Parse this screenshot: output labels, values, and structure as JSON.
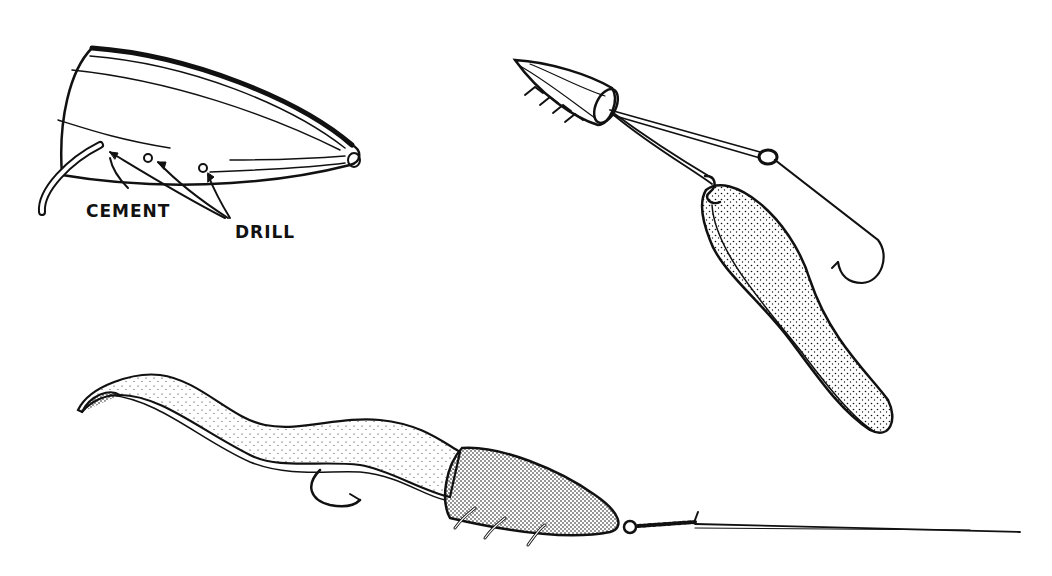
{
  "figure": {
    "labels": {
      "cement": "CEMENT",
      "drill": "DRILL"
    },
    "panels": [
      {
        "name": "lure-head-drilled",
        "caption": ""
      },
      {
        "name": "rigged-head-with-spoon-and-hook",
        "caption": ""
      },
      {
        "name": "worm-lure-on-line",
        "caption": ""
      }
    ]
  },
  "colors": {
    "ink": "#111111",
    "paper": "#ffffff"
  }
}
